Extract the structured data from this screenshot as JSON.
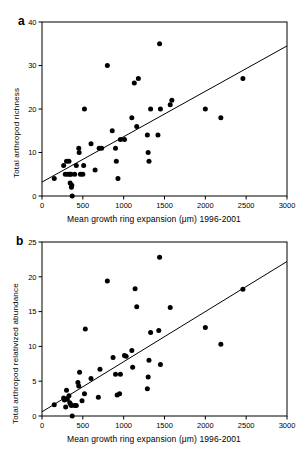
{
  "figure": {
    "panels": [
      {
        "key": "a",
        "label": "a",
        "xlabel": "Mean growth ring expansion (μm) 1996-2001",
        "ylabel": "Total arthropod richness"
      },
      {
        "key": "b",
        "label": "b",
        "xlabel": "Mean growth ring expansion (μm) 1996-2001",
        "ylabel": "Total arthropod relativized abundance"
      }
    ]
  },
  "chart_data": [
    {
      "type": "scatter",
      "panel": "a",
      "title": "",
      "xlabel": "Mean growth ring expansion (μm) 1996-2001",
      "ylabel": "Total arthropod richness",
      "xlim": [
        0,
        3000
      ],
      "ylim": [
        0,
        40
      ],
      "xticks": [
        0,
        500,
        1000,
        1500,
        2000,
        2500,
        3000
      ],
      "yticks": [
        0,
        10,
        20,
        30,
        40
      ],
      "grid": false,
      "legend": null,
      "marker": "filled-circle",
      "marker_color": "#000000",
      "trendline": {
        "x": [
          0,
          3000
        ],
        "y": [
          3.2,
          34.5
        ],
        "color": "#000000"
      },
      "points": [
        {
          "x": 150,
          "y": 4
        },
        {
          "x": 265,
          "y": 7
        },
        {
          "x": 285,
          "y": 5
        },
        {
          "x": 300,
          "y": 8
        },
        {
          "x": 315,
          "y": 5
        },
        {
          "x": 330,
          "y": 8
        },
        {
          "x": 340,
          "y": 5
        },
        {
          "x": 345,
          "y": 3
        },
        {
          "x": 355,
          "y": 5
        },
        {
          "x": 360,
          "y": 2
        },
        {
          "x": 365,
          "y": 2.5
        },
        {
          "x": 370,
          "y": 0
        },
        {
          "x": 400,
          "y": 5
        },
        {
          "x": 420,
          "y": 7
        },
        {
          "x": 450,
          "y": 11
        },
        {
          "x": 455,
          "y": 10
        },
        {
          "x": 470,
          "y": 5
        },
        {
          "x": 500,
          "y": 5
        },
        {
          "x": 510,
          "y": 7
        },
        {
          "x": 520,
          "y": 20
        },
        {
          "x": 600,
          "y": 12
        },
        {
          "x": 650,
          "y": 6
        },
        {
          "x": 700,
          "y": 11
        },
        {
          "x": 730,
          "y": 11
        },
        {
          "x": 800,
          "y": 30
        },
        {
          "x": 860,
          "y": 15
        },
        {
          "x": 900,
          "y": 11
        },
        {
          "x": 910,
          "y": 8
        },
        {
          "x": 930,
          "y": 4
        },
        {
          "x": 960,
          "y": 13
        },
        {
          "x": 1010,
          "y": 13
        },
        {
          "x": 1100,
          "y": 18
        },
        {
          "x": 1130,
          "y": 26
        },
        {
          "x": 1160,
          "y": 16
        },
        {
          "x": 1180,
          "y": 27
        },
        {
          "x": 1290,
          "y": 14
        },
        {
          "x": 1300,
          "y": 10
        },
        {
          "x": 1310,
          "y": 8
        },
        {
          "x": 1330,
          "y": 20
        },
        {
          "x": 1420,
          "y": 14
        },
        {
          "x": 1440,
          "y": 35
        },
        {
          "x": 1450,
          "y": 20
        },
        {
          "x": 1570,
          "y": 21
        },
        {
          "x": 1590,
          "y": 22
        },
        {
          "x": 2000,
          "y": 20
        },
        {
          "x": 2190,
          "y": 18
        },
        {
          "x": 2460,
          "y": 27
        }
      ]
    },
    {
      "type": "scatter",
      "panel": "b",
      "title": "",
      "xlabel": "Mean growth ring expansion (μm) 1996-2001",
      "ylabel": "Total arthropod relativized abundance",
      "xlim": [
        0,
        3000
      ],
      "ylim": [
        0,
        25
      ],
      "xticks": [
        0,
        500,
        1000,
        1500,
        2000,
        2500,
        3000
      ],
      "yticks": [
        0,
        5,
        10,
        15,
        20,
        25
      ],
      "grid": false,
      "legend": null,
      "marker": "filled-circle",
      "marker_color": "#000000",
      "trendline": {
        "x": [
          0,
          3000
        ],
        "y": [
          0.6,
          22.2
        ],
        "color": "#000000"
      },
      "points": [
        {
          "x": 150,
          "y": 1.6
        },
        {
          "x": 265,
          "y": 2.6
        },
        {
          "x": 275,
          "y": 2.3
        },
        {
          "x": 290,
          "y": 1.3
        },
        {
          "x": 300,
          "y": 3.7
        },
        {
          "x": 310,
          "y": 2.4
        },
        {
          "x": 330,
          "y": 2.9
        },
        {
          "x": 340,
          "y": 1.9
        },
        {
          "x": 350,
          "y": 1.7
        },
        {
          "x": 360,
          "y": 1.5
        },
        {
          "x": 370,
          "y": 0
        },
        {
          "x": 400,
          "y": 1.5
        },
        {
          "x": 420,
          "y": 1.5
        },
        {
          "x": 440,
          "y": 4.8
        },
        {
          "x": 450,
          "y": 4.3
        },
        {
          "x": 460,
          "y": 6.3
        },
        {
          "x": 490,
          "y": 2.2
        },
        {
          "x": 520,
          "y": 3.2
        },
        {
          "x": 530,
          "y": 12.5
        },
        {
          "x": 600,
          "y": 5.4
        },
        {
          "x": 690,
          "y": 2.7
        },
        {
          "x": 710,
          "y": 6.7
        },
        {
          "x": 800,
          "y": 19.4
        },
        {
          "x": 870,
          "y": 8.4
        },
        {
          "x": 900,
          "y": 6.0
        },
        {
          "x": 920,
          "y": 3.0
        },
        {
          "x": 950,
          "y": 3.2
        },
        {
          "x": 960,
          "y": 6.0
        },
        {
          "x": 1010,
          "y": 8.7
        },
        {
          "x": 1030,
          "y": 8.6
        },
        {
          "x": 1100,
          "y": 9.4
        },
        {
          "x": 1110,
          "y": 7.0
        },
        {
          "x": 1140,
          "y": 18.3
        },
        {
          "x": 1160,
          "y": 15.7
        },
        {
          "x": 1290,
          "y": 3.9
        },
        {
          "x": 1300,
          "y": 5.6
        },
        {
          "x": 1310,
          "y": 8.0
        },
        {
          "x": 1330,
          "y": 12.0
        },
        {
          "x": 1430,
          "y": 12.3
        },
        {
          "x": 1440,
          "y": 22.8
        },
        {
          "x": 1450,
          "y": 7.4
        },
        {
          "x": 1570,
          "y": 15.6
        },
        {
          "x": 2000,
          "y": 12.7
        },
        {
          "x": 2190,
          "y": 10.3
        },
        {
          "x": 2460,
          "y": 18.2
        }
      ]
    }
  ]
}
